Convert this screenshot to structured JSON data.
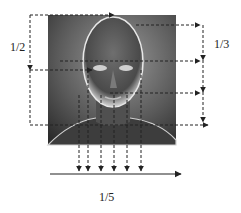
{
  "diagram": {
    "title": "",
    "image": {
      "subject": "grayscale 3D rendered head and shoulders (face) on gradient background",
      "colors": {
        "background_light": "#8a8a8a",
        "background_dark": "#2a2a2a",
        "face_highlight": "#e6e6e6"
      }
    },
    "labels": {
      "vertical_left": "1/2",
      "vertical_right": "1/3",
      "horizontal_bottom": "1/5"
    },
    "line_color": "#222222",
    "vertical_guides_count": 6,
    "horizontal_guides": [
      "top of head",
      "eyes",
      "nose",
      "chin/shoulders"
    ]
  }
}
